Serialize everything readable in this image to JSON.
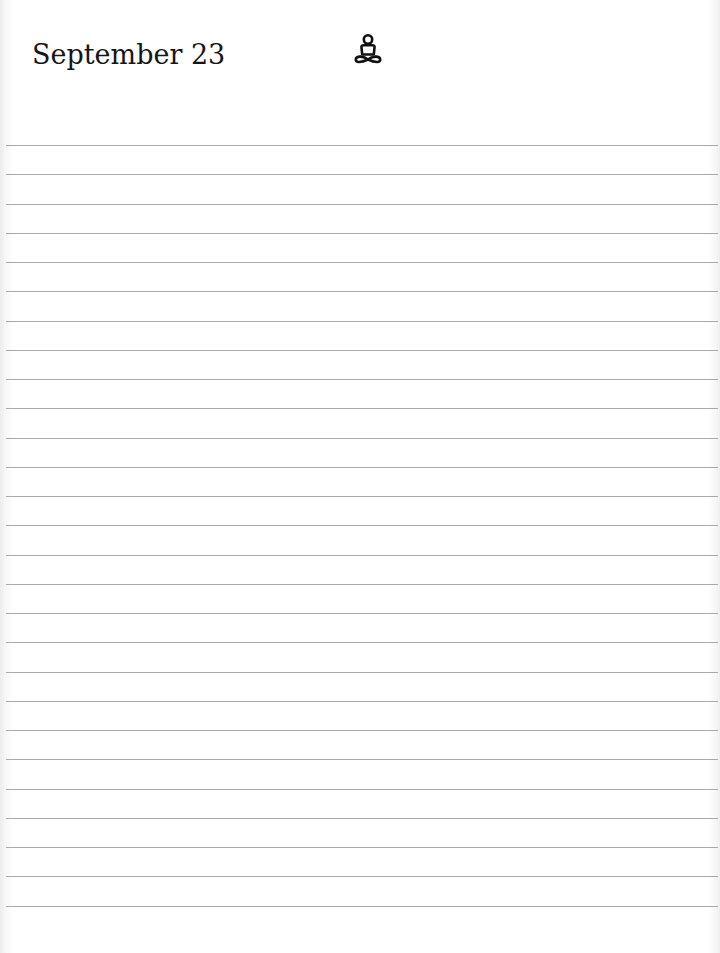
{
  "page": {
    "date_heading": "September 23",
    "header_icon": "meditation-figure-icon",
    "rule_color": "#a9a9a9"
  },
  "ruled_lines": {
    "count": 27,
    "first_y": 145,
    "spacing": 29.25
  }
}
